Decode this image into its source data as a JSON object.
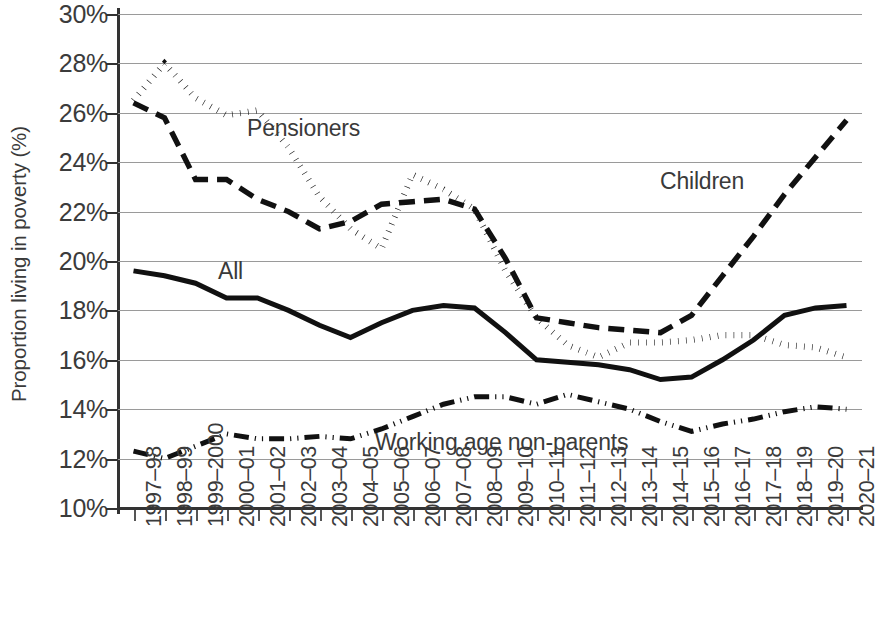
{
  "chart_data": {
    "type": "line",
    "title": "",
    "xlabel": "",
    "ylabel": "Proportion living in poverty (%)",
    "ylim": [
      10,
      30
    ],
    "ytick_labels": [
      "30%",
      "28%",
      "26%",
      "24%",
      "22%",
      "20%",
      "18%",
      "16%",
      "14%",
      "12%",
      "10%"
    ],
    "ytick_values": [
      30,
      28,
      26,
      24,
      22,
      20,
      18,
      16,
      14,
      12,
      10
    ],
    "grid": true,
    "legend_position": "inline-annotations",
    "categories": [
      "1997–98",
      "1998–99",
      "1999–2000",
      "2000–01",
      "2001–02",
      "2002–03",
      "2003–04",
      "2004–05",
      "2005–06",
      "2006–07",
      "2007–08",
      "2008–09",
      "2009–10",
      "2010–11",
      "2011–12",
      "2012–13",
      "2013–14",
      "2014–15",
      "2015–16",
      "2016–17",
      "2017–18",
      "2018–19",
      "2019–20",
      "2020–21"
    ],
    "series": [
      {
        "name": "Pensioners",
        "style": "dotted",
        "label": "Pensioners",
        "values": [
          26.5,
          28.0,
          26.6,
          25.9,
          26.1,
          24.6,
          22.6,
          21.3,
          20.5,
          23.5,
          22.9,
          22.1,
          19.6,
          17.7,
          16.6,
          16.1,
          16.7,
          16.7,
          16.8,
          17.0,
          17.0,
          16.6,
          16.5,
          16.1
        ]
      },
      {
        "name": "Children",
        "style": "dashed",
        "label": "Children",
        "values": [
          26.4,
          25.8,
          23.3,
          23.3,
          22.5,
          22.0,
          21.3,
          21.6,
          22.3,
          22.4,
          22.5,
          22.1,
          20.1,
          17.7,
          17.5,
          17.3,
          17.2,
          17.1,
          17.8,
          19.4,
          21.0,
          22.7,
          24.2,
          25.7
        ]
      },
      {
        "name": "All",
        "style": "solid",
        "label": "All",
        "values": [
          19.6,
          19.4,
          19.1,
          18.5,
          18.5,
          18.0,
          17.4,
          16.9,
          17.5,
          18.0,
          18.2,
          18.1,
          17.1,
          16.0,
          15.9,
          15.8,
          15.6,
          15.2,
          15.3,
          16.0,
          16.8,
          17.8,
          18.1,
          18.2
        ]
      },
      {
        "name": "Working age non-parents",
        "style": "dashdotdot",
        "label": "Working age non-parents",
        "values": [
          12.3,
          12.0,
          12.5,
          13.0,
          12.8,
          12.8,
          12.9,
          12.8,
          13.2,
          13.7,
          14.2,
          14.5,
          14.5,
          14.2,
          14.6,
          14.3,
          14.0,
          13.5,
          13.1,
          13.4,
          13.6,
          13.9,
          14.1,
          14.0
        ]
      }
    ],
    "annotations": [
      {
        "text": "Pensioners",
        "x_px": 247,
        "y_px": 115
      },
      {
        "text": "Children",
        "x_px": 660,
        "y_px": 168
      },
      {
        "text": "All",
        "x_px": 218,
        "y_px": 258
      },
      {
        "text": "Working age non-parents",
        "x_px": 375,
        "y_px": 429
      }
    ]
  }
}
